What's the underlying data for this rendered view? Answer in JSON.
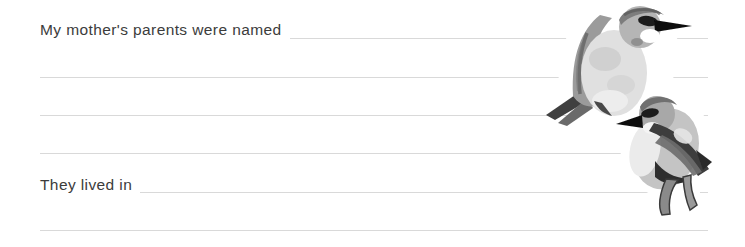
{
  "page": {
    "prompts": {
      "first": "My mother's parents were named",
      "second": "They lived in"
    },
    "answers": {
      "first": "",
      "second": ""
    },
    "illustration_alt": "Watercolor illustration of two gray birds perched together",
    "colors": {
      "background": "#ffffff",
      "text": "#3c3c3c",
      "rule_line": "#d9d9d9"
    }
  }
}
